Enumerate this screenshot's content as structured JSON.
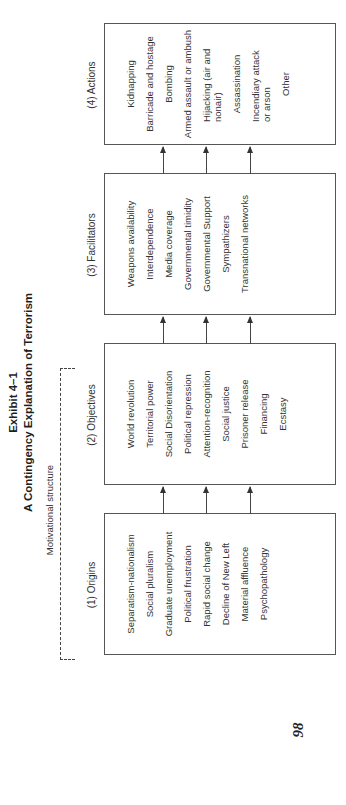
{
  "exhibit": {
    "number": "Exhibit 4–1",
    "title": "A Contingency Explanation of Terrorism"
  },
  "bracket_label": "Motivational structure",
  "columns": [
    {
      "heading": "(1) Origins",
      "items": [
        "Separatism-nationalism",
        "Social pluralism",
        "Graduate unemployment",
        "Political frustration",
        "Rapid social change",
        "Decline of New Left",
        "Material affluence",
        "Psychopathology"
      ]
    },
    {
      "heading": "(2) Objectives",
      "items": [
        "World revolution",
        "Territorial power",
        "Social Disorientation",
        "Political repression",
        "Attention-recognition",
        "Social justice",
        "Prisoner release",
        "Financing",
        "Ecstasy"
      ]
    },
    {
      "heading": "(3) Facilitators",
      "items": [
        "Weapons availability",
        "Interdependence",
        "Media coverage",
        "Governmental timidity",
        "Governmental Support",
        "Sympathizers",
        "Transnational networks"
      ]
    },
    {
      "heading": "(4) Actions",
      "items": [
        "Kidnapping",
        "Barricade and hostage",
        "Bombing",
        "Armed assault or ambush",
        "Hijacking (air and nonair)",
        "Assassination",
        "Incendiary attack or arson",
        "Other"
      ]
    }
  ],
  "page_number": "98"
}
